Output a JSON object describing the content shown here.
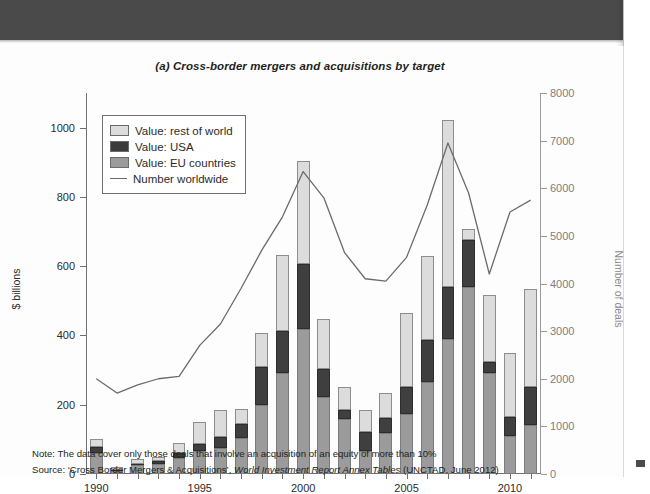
{
  "figure": {
    "title": "(a) Cross-border mergers and acquisitions by target",
    "notes": {
      "note_prefix": "Note: ",
      "note_text": "The data cover only those deals that involve an acquisition of an equity of more than 10%",
      "source_prefix": "Source: ",
      "source_text_a": "‘Cross Border Mergers & Acquisitions’, ",
      "source_text_italic": "World Investment Report Annex Tables",
      "source_text_b": " (UNCTAD, June 2012)"
    }
  },
  "legend": {
    "items": [
      {
        "label": "Value: rest of world",
        "key": "row",
        "color": "#dcdcdc"
      },
      {
        "label": "Value: USA",
        "key": "usa",
        "color": "#3b3b3b"
      },
      {
        "label": "Value: EU countries",
        "key": "eu",
        "color": "#9b9b9b"
      },
      {
        "label": "Number worldwide",
        "key": "line",
        "color": "#6b6b6b"
      }
    ]
  },
  "chart_data": {
    "type": "bar",
    "title": "(a) Cross-border mergers and acquisitions by target",
    "xlabel": "",
    "ylabel": "$ billions",
    "y2label": "Number of deals",
    "ylim": [
      0,
      1100
    ],
    "y2lim": [
      0,
      8000
    ],
    "yticks": [
      0,
      200,
      400,
      600,
      800,
      1000
    ],
    "y2ticks": [
      0,
      1000,
      2000,
      3000,
      4000,
      5000,
      6000,
      7000,
      8000
    ],
    "xticks": [
      1990,
      1995,
      2000,
      2005,
      2010
    ],
    "grid": false,
    "legend_position": "upper-left",
    "stacked": true,
    "categories": [
      1990,
      1991,
      1992,
      1993,
      1994,
      1995,
      1996,
      1997,
      1998,
      1999,
      2000,
      2001,
      2002,
      2003,
      2004,
      2005,
      2006,
      2007,
      2008,
      2009,
      2010,
      2011
    ],
    "series": [
      {
        "name": "Value: EU countries",
        "key": "eu",
        "color": "#9b9b9b",
        "values": [
          62,
          9,
          26,
          29,
          45,
          67,
          76,
          104,
          200,
          292,
          420,
          222,
          159,
          66,
          118,
          174,
          266,
          390,
          541,
          292,
          110,
          141
        ]
      },
      {
        "name": "Value: USA",
        "key": "usa",
        "color": "#3b3b3b",
        "values": [
          15,
          4,
          4,
          8,
          16,
          20,
          30,
          40,
          110,
          121,
          185,
          80,
          27,
          56,
          44,
          76,
          120,
          150,
          136,
          30,
          55,
          110
        ]
      },
      {
        "name": "Value: rest of world",
        "key": "row",
        "color": "#dcdcdc",
        "values": [
          23,
          7,
          12,
          11,
          29,
          62,
          80,
          44,
          96,
          220,
          300,
          147,
          66,
          63,
          71,
          216,
          243,
          482,
          31,
          195,
          185,
          282
        ]
      }
    ],
    "line_series": {
      "name": "Number worldwide",
      "axis": "right",
      "color": "#6b6b6b",
      "values": [
        2000,
        1700,
        1870,
        2000,
        2050,
        2700,
        3150,
        3900,
        4700,
        5400,
        6350,
        5800,
        4650,
        4100,
        4050,
        4550,
        5650,
        6950,
        5900,
        4200,
        5500,
        5750
      ]
    }
  },
  "axes": {
    "left_ticks": [
      "0",
      "200",
      "400",
      "600",
      "800",
      "1000"
    ],
    "right_ticks": [
      "0",
      "1000",
      "2000",
      "3000",
      "4000",
      "5000",
      "6000",
      "7000",
      "8000"
    ],
    "x_ticks": [
      "1990",
      "1995",
      "2000",
      "2005",
      "2010"
    ],
    "left_title": "$ billions",
    "right_title": "Number of deals"
  }
}
